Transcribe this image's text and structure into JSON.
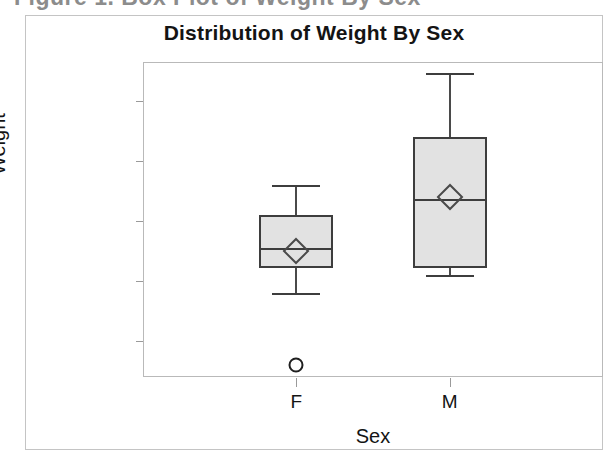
{
  "scan": {
    "top_cut_text": "Figure 1.  Box Plot of Weight By Sex"
  },
  "chart_data": {
    "type": "box",
    "title": "Distribution of Weight By Sex",
    "xlabel": "Sex",
    "ylabel": "Weight",
    "categories": [
      "F",
      "M"
    ],
    "ylim": [
      48,
      153
    ],
    "yticks": [
      60,
      80,
      100,
      120,
      140
    ],
    "ytick_labels": [
      "60",
      "80",
      "100",
      "120",
      "140"
    ],
    "grid": false,
    "legend": null,
    "boxes": [
      {
        "category": "F",
        "whisker_low": 76,
        "q1": 84.5,
        "median": 91,
        "mean": 90,
        "q3": 102,
        "whisker_high": 112,
        "outliers": [
          52
        ]
      },
      {
        "category": "M",
        "whisker_low": 82,
        "q1": 84.5,
        "median": 107.5,
        "mean": 108,
        "q3": 128,
        "whisker_high": 149.5,
        "outliers": []
      }
    ],
    "colors": {
      "box_fill": "#e2e2e2",
      "box_edge": "#3d3d3d",
      "whisker": "#4a4a4a",
      "marker": "#1f1f1f",
      "frame": "#b9b9b9",
      "text": "#141414"
    }
  }
}
